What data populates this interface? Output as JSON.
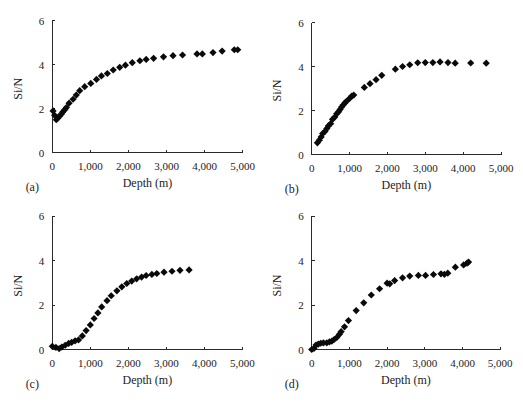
{
  "figure": {
    "panel_count": 4,
    "marker_color": "#0a0a0a",
    "axis_color": "#2b2b2b"
  },
  "chart_data": [
    {
      "id": "a",
      "type": "scatter",
      "panel_label": "(a)",
      "title": "",
      "xlabel": "Depth (m)",
      "ylabel": "Si/N",
      "xlim": [
        0,
        5000
      ],
      "ylim": [
        0,
        6
      ],
      "xticks": [
        0,
        1000,
        2000,
        3000,
        4000,
        5000
      ],
      "xtick_labels": [
        "0",
        "1,000",
        "2,000",
        "3,000",
        "4,000",
        "5,000"
      ],
      "yticks": [
        0,
        2,
        4,
        6
      ],
      "ytick_labels": [
        "0",
        "2",
        "4",
        "6"
      ],
      "grid": false,
      "legend": null,
      "marker": "diamond",
      "x": [
        20,
        60,
        105,
        150,
        195,
        240,
        280,
        325,
        370,
        440,
        545,
        630,
        720,
        850,
        1010,
        1160,
        1290,
        1445,
        1600,
        1770,
        1920,
        2100,
        2300,
        2465,
        2660,
        2920,
        3170,
        3420,
        3800,
        3940,
        4220,
        4460,
        4780,
        4870
      ],
      "y": [
        1.9,
        1.7,
        1.5,
        1.58,
        1.67,
        1.76,
        1.86,
        1.95,
        2.05,
        2.25,
        2.43,
        2.62,
        2.82,
        3.0,
        3.15,
        3.33,
        3.49,
        3.6,
        3.76,
        3.88,
        3.98,
        4.09,
        4.18,
        4.24,
        4.29,
        4.36,
        4.41,
        4.44,
        4.49,
        4.49,
        4.55,
        4.62,
        4.68,
        4.68
      ]
    },
    {
      "id": "b",
      "type": "scatter",
      "panel_label": "(b)",
      "title": "",
      "xlabel": "Depth (m)",
      "ylabel": "Si/N",
      "xlim": [
        0,
        5000
      ],
      "ylim": [
        0,
        6
      ],
      "xticks": [
        0,
        1000,
        2000,
        3000,
        4000,
        5000
      ],
      "xtick_labels": [
        "0",
        "1,000",
        "2,000",
        "3,000",
        "4,000",
        "5,000"
      ],
      "yticks": [
        0,
        2,
        4,
        6
      ],
      "ytick_labels": [
        "0",
        "2",
        "4",
        "6"
      ],
      "grid": false,
      "legend": null,
      "marker": "diamond",
      "x": [
        150,
        200,
        250,
        290,
        350,
        400,
        440,
        500,
        550,
        610,
        660,
        710,
        750,
        790,
        830,
        880,
        920,
        1000,
        1055,
        1110,
        1390,
        1540,
        1700,
        1850,
        2210,
        2400,
        2590,
        2800,
        3000,
        3200,
        3390,
        3600,
        3790,
        4200,
        4610
      ],
      "y": [
        0.53,
        0.65,
        0.8,
        0.95,
        1.05,
        1.18,
        1.3,
        1.4,
        1.6,
        1.7,
        1.85,
        1.94,
        2.05,
        2.16,
        2.25,
        2.35,
        2.42,
        2.55,
        2.65,
        2.7,
        3.05,
        3.22,
        3.4,
        3.6,
        3.88,
        4.0,
        4.08,
        4.17,
        4.18,
        4.18,
        4.21,
        4.18,
        4.15,
        4.16,
        4.15
      ]
    },
    {
      "id": "c",
      "type": "scatter",
      "panel_label": "(c)",
      "title": "",
      "xlabel": "Depth (m)",
      "ylabel": "Si/N",
      "xlim": [
        0,
        5000
      ],
      "ylim": [
        0,
        6
      ],
      "xticks": [
        0,
        1000,
        2000,
        3000,
        4000,
        5000
      ],
      "xtick_labels": [
        "0",
        "1,000",
        "2,000",
        "3,000",
        "4,000",
        "5,000"
      ],
      "yticks": [
        0,
        2,
        4,
        6
      ],
      "ytick_labels": [
        "0",
        "2",
        "4",
        "6"
      ],
      "grid": false,
      "legend": null,
      "marker": "diamond",
      "x": [
        0,
        95,
        180,
        250,
        340,
        430,
        510,
        600,
        690,
        790,
        890,
        1000,
        1100,
        1200,
        1300,
        1440,
        1550,
        1700,
        1830,
        1960,
        2090,
        2220,
        2350,
        2470,
        2620,
        2750,
        2940,
        3150,
        3360,
        3600
      ],
      "y": [
        0.15,
        0.1,
        0.05,
        0.12,
        0.2,
        0.28,
        0.33,
        0.4,
        0.44,
        0.62,
        0.86,
        1.11,
        1.4,
        1.65,
        1.92,
        2.2,
        2.42,
        2.64,
        2.82,
        2.97,
        3.08,
        3.18,
        3.26,
        3.33,
        3.38,
        3.42,
        3.48,
        3.52,
        3.56,
        3.58
      ]
    },
    {
      "id": "d",
      "type": "scatter",
      "panel_label": "(d)",
      "title": "",
      "xlabel": "Depth (m)",
      "ylabel": "Si/N",
      "xlim": [
        0,
        5000
      ],
      "ylim": [
        0,
        6
      ],
      "xticks": [
        0,
        1000,
        2000,
        3000,
        4000,
        5000
      ],
      "xtick_labels": [
        "0",
        "1,000",
        "2,000",
        "3,000",
        "4,000",
        "5,000"
      ],
      "yticks": [
        0,
        2,
        4,
        6
      ],
      "ytick_labels": [
        "0",
        "2",
        "4",
        "6"
      ],
      "grid": false,
      "legend": null,
      "marker": "diamond",
      "x": [
        0,
        60,
        115,
        175,
        240,
        310,
        400,
        470,
        535,
        595,
        665,
        735,
        780,
        870,
        975,
        1180,
        1380,
        1580,
        1800,
        2000,
        2070,
        2200,
        2410,
        2600,
        2830,
        3020,
        3230,
        3430,
        3520,
        3610,
        3810,
        4030,
        4120,
        4160
      ],
      "y": [
        0,
        0.05,
        0.2,
        0.24,
        0.28,
        0.3,
        0.3,
        0.34,
        0.38,
        0.45,
        0.54,
        0.68,
        0.8,
        1.02,
        1.3,
        1.75,
        2.1,
        2.45,
        2.73,
        2.98,
        2.95,
        3.1,
        3.22,
        3.3,
        3.33,
        3.33,
        3.37,
        3.4,
        3.38,
        3.43,
        3.7,
        3.8,
        3.88,
        3.93
      ]
    }
  ]
}
